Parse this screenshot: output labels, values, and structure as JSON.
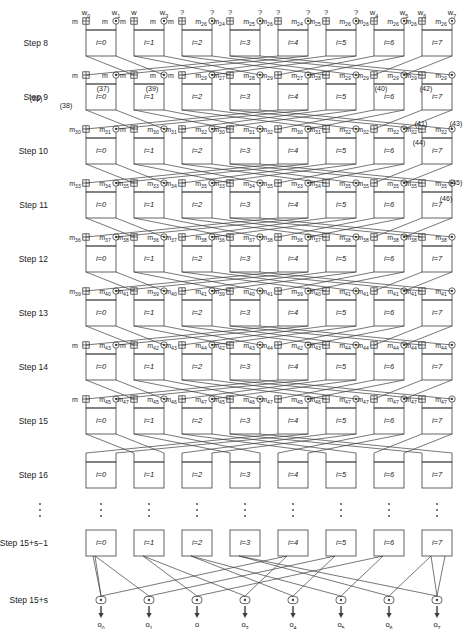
{
  "figure": {
    "type": "butterfly-network-diagram",
    "width": 474,
    "height": 629,
    "line_color": "#3c3c3c",
    "text_color": "#1a1a1a",
    "background": "#ffffff"
  },
  "column_headers": [
    {
      "text": "w",
      "sub": "0"
    },
    {
      "text": "w",
      "sub": "1"
    },
    {
      "text": "w",
      "sub": ""
    },
    {
      "text": "w",
      "sub": "3"
    },
    {
      "text": "?",
      "sub": ""
    },
    {
      "text": "?",
      "sub": ""
    },
    {
      "text": "?",
      "sub": ""
    },
    {
      "text": "?",
      "sub": ""
    },
    {
      "text": "?",
      "sub": ""
    },
    {
      "text": "?",
      "sub": ""
    },
    {
      "text": "?",
      "sub": ""
    },
    {
      "text": "?",
      "sub": ""
    },
    {
      "text": "w",
      "sub": "4"
    },
    {
      "text": "w",
      "sub": "5"
    },
    {
      "text": "w",
      "sub": "6"
    },
    {
      "text": "w",
      "sub": "7"
    }
  ],
  "rows": [
    {
      "step_label": "Step 8",
      "box_labels": [
        "i=0",
        "i=1",
        "i=2",
        "i=3",
        "i=4",
        "i=5",
        "i=6",
        "i=7"
      ],
      "operands": [
        {
          "text": "m",
          "sub": ""
        },
        {
          "text": "m",
          "sub": ""
        },
        {
          "text": "m",
          "sub": ""
        },
        {
          "text": "m",
          "sub": ""
        },
        {
          "text": "m",
          "sub": ""
        },
        {
          "text": "m",
          "sub": "26"
        },
        {
          "text": "m",
          "sub": "24"
        },
        {
          "text": "m",
          "sub": "25"
        },
        {
          "text": "m",
          "sub": "26"
        },
        {
          "text": "m",
          "sub": "24"
        },
        {
          "text": "m",
          "sub": "25"
        },
        {
          "text": "m",
          "sub": "26"
        }
      ]
    },
    {
      "step_label": "Step 9",
      "box_labels": [
        "i=0",
        "i=1",
        "i=2",
        "i=3",
        "i=4",
        "i=5",
        "i=6",
        "i=7"
      ],
      "operands": [
        {
          "text": "m",
          "sub": ""
        },
        {
          "text": "m",
          "sub": ""
        },
        {
          "text": "m",
          "sub": ""
        },
        {
          "text": "m",
          "sub": ""
        },
        {
          "text": "m",
          "sub": ""
        },
        {
          "text": "m",
          "sub": "29"
        },
        {
          "text": "m",
          "sub": "27"
        },
        {
          "text": "m",
          "sub": "28"
        },
        {
          "text": "m",
          "sub": "29"
        },
        {
          "text": "m",
          "sub": "27"
        },
        {
          "text": "m",
          "sub": "28"
        },
        {
          "text": "m",
          "sub": "29"
        }
      ]
    },
    {
      "step_label": "Step 10",
      "box_labels": [
        "i=0",
        "i=1",
        "i=2",
        "i=3",
        "i=4",
        "i=5",
        "i=6",
        "i=7"
      ],
      "operands": [
        {
          "text": "m",
          "sub": "30"
        },
        {
          "text": "m",
          "sub": "31"
        },
        {
          "text": "m",
          "sub": ""
        },
        {
          "text": "m",
          "sub": "30"
        },
        {
          "text": "m",
          "sub": "31"
        },
        {
          "text": "m",
          "sub": "32"
        },
        {
          "text": "m",
          "sub": "30"
        },
        {
          "text": "m",
          "sub": "31"
        },
        {
          "text": "m",
          "sub": "32"
        },
        {
          "text": "m",
          "sub": "30"
        },
        {
          "text": "m",
          "sub": "31"
        },
        {
          "text": "m",
          "sub": "32"
        }
      ]
    },
    {
      "step_label": "Step 11",
      "box_labels": [
        "i=0",
        "i=1",
        "i=2",
        "i=3",
        "i=4",
        "i=5",
        "i=6",
        "i=7"
      ],
      "operands": [
        {
          "text": "m",
          "sub": "33"
        },
        {
          "text": "m",
          "sub": "34"
        },
        {
          "text": "m",
          "sub": "35"
        },
        {
          "text": "m",
          "sub": "33"
        },
        {
          "text": "m",
          "sub": "34"
        },
        {
          "text": "m",
          "sub": "35"
        },
        {
          "text": "m",
          "sub": "33"
        },
        {
          "text": "m",
          "sub": "34"
        },
        {
          "text": "m",
          "sub": "35"
        },
        {
          "text": "m",
          "sub": "33"
        },
        {
          "text": "m",
          "sub": "34"
        },
        {
          "text": "m",
          "sub": "35"
        }
      ]
    },
    {
      "step_label": "Step 12",
      "box_labels": [
        "i=0",
        "i=1",
        "i=2",
        "i=3",
        "i=4",
        "i=5",
        "i=6",
        "i=7"
      ],
      "operands": [
        {
          "text": "m",
          "sub": "36"
        },
        {
          "text": "m",
          "sub": "37"
        },
        {
          "text": "m",
          "sub": "38"
        },
        {
          "text": "m",
          "sub": "36"
        },
        {
          "text": "m",
          "sub": "37"
        },
        {
          "text": "m",
          "sub": "38"
        },
        {
          "text": "m",
          "sub": "36"
        },
        {
          "text": "m",
          "sub": "37"
        },
        {
          "text": "m",
          "sub": "38"
        },
        {
          "text": "m",
          "sub": "36"
        },
        {
          "text": "m",
          "sub": "37"
        },
        {
          "text": "m",
          "sub": "38"
        }
      ]
    },
    {
      "step_label": "Step 13",
      "box_labels": [
        "i=0",
        "i=1",
        "i=2",
        "i=3",
        "i=4",
        "i=5",
        "i=6",
        "i=7"
      ],
      "operands": [
        {
          "text": "m",
          "sub": "39"
        },
        {
          "text": "m",
          "sub": "40"
        },
        {
          "text": "m",
          "sub": "41"
        },
        {
          "text": "m",
          "sub": "39"
        },
        {
          "text": "m",
          "sub": "40"
        },
        {
          "text": "m",
          "sub": "41"
        },
        {
          "text": "m",
          "sub": "39"
        },
        {
          "text": "m",
          "sub": "40"
        },
        {
          "text": "m",
          "sub": "41"
        },
        {
          "text": "m",
          "sub": "39"
        },
        {
          "text": "m",
          "sub": "40"
        },
        {
          "text": "m",
          "sub": "41"
        }
      ]
    },
    {
      "step_label": "Step 14",
      "box_labels": [
        "i=0",
        "i=1",
        "i=2",
        "i=3",
        "i=4",
        "i=5",
        "i=6",
        "i=7"
      ],
      "operands": [
        {
          "text": "m",
          "sub": ""
        },
        {
          "text": "m",
          "sub": "43"
        },
        {
          "text": "m",
          "sub": ""
        },
        {
          "text": "m",
          "sub": "42"
        },
        {
          "text": "m",
          "sub": "43"
        },
        {
          "text": "m",
          "sub": "44"
        },
        {
          "text": "m",
          "sub": "42"
        },
        {
          "text": "m",
          "sub": "43"
        },
        {
          "text": "m",
          "sub": "44"
        },
        {
          "text": "m",
          "sub": "42"
        },
        {
          "text": "m",
          "sub": "43"
        },
        {
          "text": "m",
          "sub": "44"
        }
      ]
    },
    {
      "step_label": "Step 15",
      "box_labels": [
        "i=0",
        "i=1",
        "i=2",
        "i=3",
        "i=4",
        "i=5",
        "i=6",
        "i=7"
      ],
      "operands": [
        {
          "text": "m",
          "sub": ""
        },
        {
          "text": "m",
          "sub": "45"
        },
        {
          "text": "m",
          "sub": "47"
        },
        {
          "text": "m",
          "sub": "45"
        },
        {
          "text": "m",
          "sub": "46"
        },
        {
          "text": "m",
          "sub": "47"
        },
        {
          "text": "m",
          "sub": "45"
        },
        {
          "text": "m",
          "sub": "46"
        },
        {
          "text": "m",
          "sub": "47"
        },
        {
          "text": "m",
          "sub": "45"
        },
        {
          "text": "m",
          "sub": "46"
        },
        {
          "text": "m",
          "sub": "47"
        }
      ]
    },
    {
      "step_label": "Step 16",
      "box_labels": [
        "i=0",
        "i=1",
        "i=2",
        "i=3",
        "i=4",
        "i=5",
        "i=6",
        "i=7"
      ],
      "operands": []
    },
    {
      "step_label": "Step 15+s−1",
      "box_labels": [
        "i=0",
        "i=1",
        "i=2",
        "i=3",
        "i=4",
        "i=5",
        "i=6",
        "i=7"
      ],
      "operands": []
    }
  ],
  "final_row": {
    "step_label": "Step 15+s"
  },
  "equation_refs": [
    {
      "label": "(36)",
      "x": 36,
      "y": 98
    },
    {
      "label": "(37)",
      "x": 103,
      "y": 88
    },
    {
      "label": "(38)",
      "x": 66,
      "y": 105
    },
    {
      "label": "(39)",
      "x": 152,
      "y": 88
    },
    {
      "label": "(40)",
      "x": 381,
      "y": 88
    },
    {
      "label": "(41)",
      "x": 421,
      "y": 123
    },
    {
      "label": "(42)",
      "x": 426,
      "y": 88
    },
    {
      "label": "(43)",
      "x": 456,
      "y": 123
    },
    {
      "label": "(44)",
      "x": 419,
      "y": 142
    },
    {
      "label": "(45)",
      "x": 456,
      "y": 182
    },
    {
      "label": "(46)",
      "x": 446,
      "y": 198
    }
  ],
  "outputs": [
    {
      "text": "o",
      "sub": "0"
    },
    {
      "text": "o",
      "sub": "1"
    },
    {
      "text": "o",
      "sub": ""
    },
    {
      "text": "o",
      "sub": "3"
    },
    {
      "text": "o",
      "sub": "4"
    },
    {
      "text": "o",
      "sub": "5"
    },
    {
      "text": "o",
      "sub": "6"
    },
    {
      "text": "o",
      "sub": "7"
    }
  ],
  "icons": {
    "xor_gate": "xor-circle-plus-icon",
    "dot_gate": "dot-circle-icon",
    "arrow_down": "arrow-down-icon",
    "vertical_ellipsis": "vertical-ellipsis-icon"
  },
  "geometry": {
    "col_left_x": [
      86,
      150,
      214,
      278,
      342,
      406
    ],
    "lane_count": 8,
    "first_row_box_top": 30,
    "row_pitch": 54
  }
}
